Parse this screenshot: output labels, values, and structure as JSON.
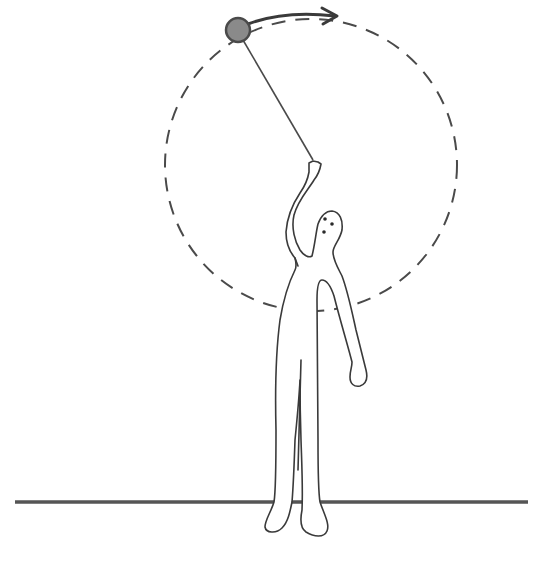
{
  "figure": {
    "description": "Person swinging a ball on a string in a vertical circle",
    "colors": {
      "line": "#3a3a3a",
      "ball_fill": "#8a8a8a",
      "ball_stroke": "#4a4a4a",
      "ground": "#555555",
      "background": "#ffffff"
    },
    "circle": {
      "cx": 311,
      "cy": 165,
      "r": 146,
      "style": "dashed"
    },
    "ball": {
      "cx": 238,
      "cy": 30,
      "r": 12
    },
    "string": {
      "x1": 243,
      "y1": 40,
      "x2": 313,
      "y2": 160
    },
    "motion_arrow": {
      "direction": "clockwise",
      "icon": "arrow-right-icon"
    },
    "ground": {
      "y": 502,
      "x1": 15,
      "x2": 528
    }
  }
}
